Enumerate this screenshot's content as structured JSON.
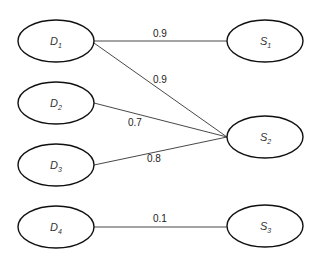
{
  "diagram": {
    "type": "bipartite-graph",
    "colors": {
      "node_stroke": "#111111",
      "edge": "#333333",
      "background": "#ffffff"
    },
    "left_nodes": [
      {
        "id": "D1",
        "letter": "D",
        "sub": "1"
      },
      {
        "id": "D2",
        "letter": "D",
        "sub": "2"
      },
      {
        "id": "D3",
        "letter": "D",
        "sub": "3"
      },
      {
        "id": "D4",
        "letter": "D",
        "sub": "4"
      }
    ],
    "right_nodes": [
      {
        "id": "S1",
        "letter": "S",
        "sub": "1"
      },
      {
        "id": "S2",
        "letter": "S",
        "sub": "2"
      },
      {
        "id": "S3",
        "letter": "S",
        "sub": "3"
      }
    ],
    "edges": [
      {
        "from": "D1",
        "to": "S1",
        "weight": "0.9"
      },
      {
        "from": "D1",
        "to": "S2",
        "weight": "0.9"
      },
      {
        "from": "D2",
        "to": "S2",
        "weight": "0.7"
      },
      {
        "from": "D3",
        "to": "S2",
        "weight": "0.8"
      },
      {
        "from": "D4",
        "to": "S3",
        "weight": "0.1"
      }
    ]
  }
}
